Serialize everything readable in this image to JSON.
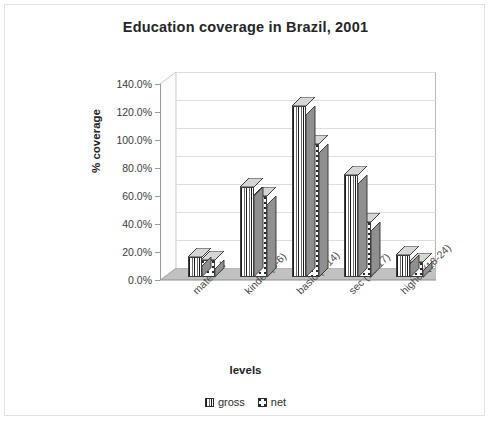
{
  "chart_data": {
    "type": "bar",
    "title": "Education coverage in Brazil, 2001",
    "xlabel": "levels",
    "ylabel": "% coverage",
    "categories": [
      "maternal",
      "kinder (3-6)",
      "basic (7-14)",
      "sec (15-17)",
      "higher (18-24)"
    ],
    "series": [
      {
        "name": "gross",
        "values": [
          14,
          64,
          122,
          73,
          16
        ]
      },
      {
        "name": "net",
        "values": [
          12,
          58,
          95,
          39,
          11
        ]
      }
    ],
    "ylim": [
      0,
      140
    ],
    "ytick_step": 20,
    "yticks": [
      "0.0%",
      "20.0%",
      "40.0%",
      "60.0%",
      "80.0%",
      "100.0%",
      "120.0%",
      "140.0%"
    ],
    "grid": true,
    "legend_position": "bottom",
    "style": "3d-columns",
    "colors": {
      "gross_fill": "#ffffff",
      "gross_pattern": "vertical-stripes",
      "net_fill": "#ffffff",
      "net_pattern": "dots",
      "outline": "#3c3c3c",
      "gridline": "#dedede",
      "floor": "#b0b0b0",
      "text": "#262626"
    }
  },
  "legend": {
    "items": [
      {
        "label": "gross",
        "pattern": "vertical-stripes"
      },
      {
        "label": "net",
        "pattern": "dots"
      }
    ]
  }
}
